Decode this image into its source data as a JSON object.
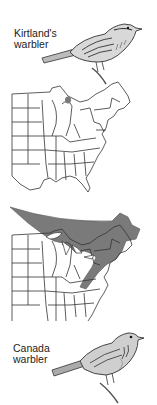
{
  "figure": {
    "top_species": {
      "label_line1": "Kirtland's",
      "label_line2": "warbler",
      "range_note": "small breeding area in northern Lower Michigan"
    },
    "bottom_species": {
      "label_line1": "Canada",
      "label_line2": "warbler",
      "range_note": "breeding range across southern Canada, Great Lakes, New England and Appalachians"
    },
    "colors": {
      "outline": "#333333",
      "range_fill": "#7a7a7a",
      "background": "#ffffff"
    }
  }
}
